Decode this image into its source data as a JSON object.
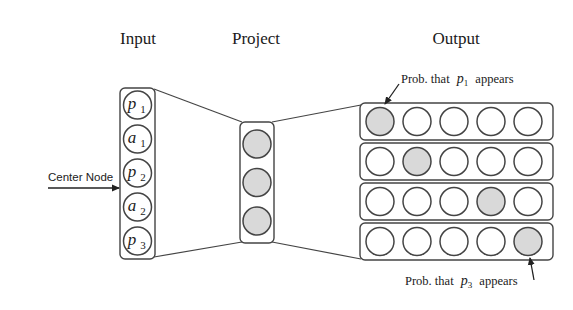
{
  "titles": {
    "input": "Input",
    "project": "Project",
    "output": "Output"
  },
  "input_layer": {
    "nodes": [
      {
        "var": "p",
        "sub": "1"
      },
      {
        "var": "a",
        "sub": "1"
      },
      {
        "var": "p",
        "sub": "2"
      },
      {
        "var": "a",
        "sub": "2"
      },
      {
        "var": "p",
        "sub": "3"
      }
    ],
    "center_node_label": "Center Node",
    "center_node_index": 2
  },
  "project_layer": {
    "node_count": 3,
    "fill": "#d9d9d9"
  },
  "output_layer": {
    "rows": [
      {
        "highlighted_index": 0
      },
      {
        "highlighted_index": 1
      },
      {
        "highlighted_index": 3
      },
      {
        "highlighted_index": 4
      }
    ],
    "nodes_per_row": 5,
    "highlight_fill": "#d9d9d9"
  },
  "annotations": {
    "top": {
      "prefix": "Prob. that",
      "var": "p",
      "sub": "1",
      "suffix": "appears"
    },
    "bottom": {
      "prefix": "Prob. that",
      "var": "p",
      "sub": "3",
      "suffix": "appears"
    }
  }
}
